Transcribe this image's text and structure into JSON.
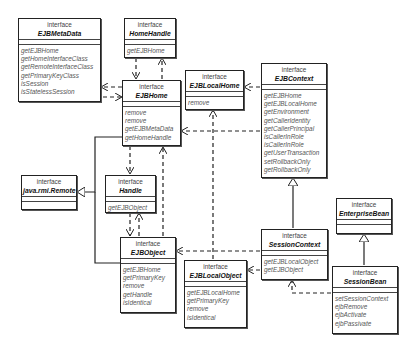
{
  "diagram": {
    "type": "UML class diagram",
    "stereotype_label": "interface",
    "classes": [
      {
        "id": "ejbmetadata",
        "name": "EJBMetaData",
        "operations": [
          "getEJBHome",
          "getHomeInterfaceClass",
          "getRemoteInterfaceClass",
          "getPrimaryKeyClass",
          "isSession",
          "isStatelessSession"
        ]
      },
      {
        "id": "homehandle",
        "name": "HomeHandle",
        "operations": [
          "getEJBHome"
        ]
      },
      {
        "id": "ejbhome",
        "name": "EJBHome",
        "operations": [
          "remove",
          "remove",
          "getEJBMetaData",
          "getHomeHandle"
        ]
      },
      {
        "id": "ejblocalhome",
        "name": "EJBLocalHome",
        "operations": [
          "remove"
        ]
      },
      {
        "id": "ejbcontext",
        "name": "EJBContext",
        "operations": [
          "getEJBHome",
          "getEJBLocalHome",
          "getEnvironment",
          "getCallerIdentity",
          "getCallerPrincipal",
          "isCallerInRole",
          "isCallerInRole",
          "getUserTransaction",
          "setRollbackOnly",
          "getRollbackOnly"
        ]
      },
      {
        "id": "remote",
        "name": "java.rmi.Remote",
        "operations": []
      },
      {
        "id": "handle",
        "name": "Handle",
        "operations": [
          "getEJBObject"
        ]
      },
      {
        "id": "ejbobject",
        "name": "EJBObject",
        "operations": [
          "getEJBHome",
          "getPrimaryKey",
          "remove",
          "getHandle",
          "isIdentical"
        ]
      },
      {
        "id": "ejblocalobject",
        "name": "EJBLocalObject",
        "operations": [
          "getEJBLocalHome",
          "getPrimaryKey",
          "remove",
          "isIdentical"
        ]
      },
      {
        "id": "sessioncontext",
        "name": "SessionContext",
        "operations": [
          "getEJBLocalObject",
          "getEJBObject"
        ]
      },
      {
        "id": "enterprisebean",
        "name": "EnterpriseBean",
        "operations": []
      },
      {
        "id": "sessionbean",
        "name": "SessionBean",
        "operations": [
          "setSessionContext",
          "ejbRemove",
          "ejbActivate",
          "ejbPassivate"
        ]
      }
    ],
    "relationships": [
      {
        "from": "EJBHome",
        "to": "EJBMetaData",
        "kind": "dependency"
      },
      {
        "from": "EJBMetaData",
        "to": "EJBHome",
        "kind": "dependency"
      },
      {
        "from": "HomeHandle",
        "to": "EJBHome",
        "kind": "dependency"
      },
      {
        "from": "EJBHome",
        "to": "HomeHandle",
        "kind": "dependency"
      },
      {
        "from": "EJBContext",
        "to": "EJBLocalHome",
        "kind": "dependency"
      },
      {
        "from": "EJBContext",
        "to": "EJBHome",
        "kind": "dependency"
      },
      {
        "from": "EJBHome",
        "to": "Handle",
        "kind": "dependency"
      },
      {
        "from": "EJBObject",
        "to": "EJBHome",
        "kind": "dependency"
      },
      {
        "from": "Handle",
        "to": "EJBObject",
        "kind": "dependency"
      },
      {
        "from": "EJBObject",
        "to": "Handle",
        "kind": "dependency"
      },
      {
        "from": "EJBLocalObject",
        "to": "EJBLocalHome",
        "kind": "dependency"
      },
      {
        "from": "SessionContext",
        "to": "EJBObject",
        "kind": "dependency"
      },
      {
        "from": "SessionContext",
        "to": "EJBLocalObject",
        "kind": "dependency"
      },
      {
        "from": "SessionBean",
        "to": "SessionContext",
        "kind": "dependency"
      },
      {
        "from": "EJBHome",
        "to": "java.rmi.Remote",
        "kind": "generalization"
      },
      {
        "from": "EJBObject",
        "to": "java.rmi.Remote",
        "kind": "generalization"
      },
      {
        "from": "SessionContext",
        "to": "EJBContext",
        "kind": "generalization"
      },
      {
        "from": "SessionBean",
        "to": "EnterpriseBean",
        "kind": "generalization"
      }
    ]
  }
}
